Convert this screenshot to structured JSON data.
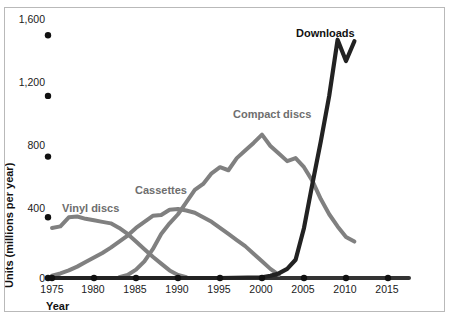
{
  "figure": {
    "background": "#ffffff",
    "page_background": "#c8c8c8",
    "frame_color": "#b9b9b9"
  },
  "axes": {
    "x_title": "Year",
    "y_title": "Units (millions per year)",
    "x_ticks": [
      "1975",
      "1980",
      "1985",
      "1990",
      "1995",
      "2000",
      "2005",
      "2010",
      "2015"
    ],
    "y_ticks": [
      "0",
      "400",
      "800",
      "1,200",
      "1,600"
    ],
    "tick_marker_color": "#111111",
    "baseline_color": "#333333"
  },
  "series_labels": {
    "vinyl": "Vinyl discs",
    "cassettes": "Cassettes",
    "compact_discs": "Compact discs",
    "downloads": "Downloads"
  },
  "colors": {
    "gray_series": "#808080",
    "dark_series": "#222222",
    "text": "#1a1a1a"
  },
  "chart_data": {
    "type": "line",
    "title": "",
    "xlabel": "Year",
    "ylabel": "Units (millions per year)",
    "xlim": [
      1975,
      2015
    ],
    "ylim": [
      0,
      1700
    ],
    "yticks": [
      0,
      400,
      800,
      1200,
      1600
    ],
    "xticks": [
      1975,
      1980,
      1985,
      1990,
      1995,
      2000,
      2005,
      2010,
      2015
    ],
    "grid": false,
    "legend": "inline-annotations",
    "series": [
      {
        "name": "Vinyl discs",
        "color": "#808080",
        "x": [
          1975,
          1976,
          1977,
          1978,
          1979,
          1980,
          1981,
          1982,
          1983,
          1984,
          1985,
          1986,
          1987,
          1988,
          1989,
          1990,
          1991
        ],
        "values": [
          330,
          340,
          400,
          405,
          390,
          380,
          370,
          360,
          330,
          290,
          240,
          190,
          140,
          95,
          50,
          20,
          5
        ]
      },
      {
        "name": "Cassettes",
        "color": "#808080",
        "x": [
          1975,
          1976,
          1977,
          1978,
          1979,
          1980,
          1981,
          1982,
          1983,
          1984,
          1985,
          1986,
          1987,
          1988,
          1989,
          1990,
          1991,
          1992,
          1993,
          1994,
          1995,
          1996,
          1997,
          1998,
          1999,
          2000,
          2001,
          2002
        ],
        "values": [
          15,
          30,
          50,
          75,
          105,
          135,
          165,
          200,
          240,
          280,
          330,
          370,
          410,
          415,
          450,
          455,
          445,
          430,
          400,
          370,
          330,
          290,
          250,
          210,
          160,
          110,
          60,
          20
        ]
      },
      {
        "name": "Compact discs",
        "color": "#808080",
        "x": [
          1983,
          1984,
          1985,
          1986,
          1987,
          1988,
          1989,
          1990,
          1991,
          1992,
          1993,
          1994,
          1995,
          1996,
          1997,
          1998,
          1999,
          2000,
          2001,
          2002,
          2003,
          2004,
          2005,
          2006,
          2007,
          2008,
          2009,
          2010,
          2011
        ],
        "values": [
          5,
          20,
          55,
          110,
          190,
          290,
          360,
          420,
          500,
          580,
          620,
          690,
          730,
          710,
          790,
          840,
          890,
          945,
          870,
          820,
          770,
          790,
          730,
          640,
          520,
          420,
          340,
          270,
          240
        ]
      },
      {
        "name": "Downloads",
        "color": "#222222",
        "x": [
          1975,
          1995,
          2000,
          2001,
          2002,
          2003,
          2004,
          2005,
          2006,
          2007,
          2008,
          2009,
          2010,
          2011
        ],
        "values": [
          0,
          0,
          5,
          15,
          30,
          60,
          120,
          330,
          620,
          900,
          1200,
          1570,
          1430,
          1560
        ]
      }
    ]
  }
}
